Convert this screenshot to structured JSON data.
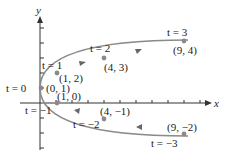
{
  "figure": {
    "axes": {
      "x_label": "x",
      "y_label": "y"
    },
    "curve_color": "#8a8a8a",
    "axis_color": "#333333",
    "points": [
      {
        "t_label": "t = 3",
        "coord_label": "(9, 4)",
        "x": 9,
        "y": 4
      },
      {
        "t_label": "t = 2",
        "coord_label": "(4, 3)",
        "x": 4,
        "y": 3
      },
      {
        "t_label": "t = 1",
        "coord_label": "(1, 2)",
        "x": 1,
        "y": 2
      },
      {
        "t_label": "t = 0",
        "coord_label": "(0, 1)",
        "x": 0,
        "y": 1
      },
      {
        "t_label": "t = −1",
        "coord_label": "(1, 0)",
        "x": 1,
        "y": 0
      },
      {
        "t_label": "t = −2",
        "coord_label": "(4, −1)",
        "x": 4,
        "y": -1
      },
      {
        "t_label": "t = −3",
        "coord_label": "(9, −2)",
        "x": 9,
        "y": -2
      }
    ]
  }
}
